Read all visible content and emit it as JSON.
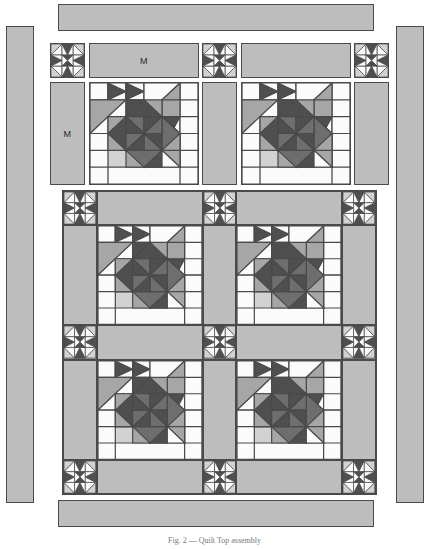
{
  "figure": {
    "caption": "Fig. 2 — Quilt Top assembly",
    "background_color": "#ffffff"
  },
  "palette": {
    "outline": "#4a4a4a",
    "sashing": "#bdbdbd",
    "border": "#bdbdbd",
    "background_light": "#f4f4f4",
    "white": "#fbfbfb",
    "light_gray": "#d2d2d2",
    "mid_gray": "#a6a6a6",
    "dark_gray": "#6e6e6e",
    "darkest_gray": "#4f4f4f"
  },
  "labels": {
    "sashing_mark": "M",
    "border_mark": "M"
  },
  "legend_marks": [
    {
      "name": "top-horizontal-sashing-mark",
      "text": "M"
    },
    {
      "name": "left-vertical-sashing-mark",
      "text": "M"
    }
  ],
  "components": {
    "outer_borders": [
      {
        "name": "outer-border-top",
        "label": "",
        "x": 58,
        "y": 4,
        "w": 316,
        "h": 27
      },
      {
        "name": "outer-border-left",
        "label": "",
        "x": 6,
        "y": 26,
        "w": 28,
        "h": 477
      },
      {
        "name": "outer-border-right",
        "label": "",
        "x": 396,
        "y": 26,
        "w": 28,
        "h": 477
      },
      {
        "name": "outer-border-bottom",
        "label": "",
        "x": 58,
        "y": 500,
        "w": 316,
        "h": 27
      }
    ],
    "top_row": [
      {
        "type": "pinwheel",
        "name": "pinwheel-top-left",
        "x": 50,
        "y": 43,
        "w": 35,
        "h": 35
      },
      {
        "type": "sashing",
        "name": "sashing-top-first",
        "label": "M",
        "x": 89,
        "y": 43,
        "w": 110,
        "h": 35
      },
      {
        "type": "pinwheel",
        "name": "pinwheel-top-center",
        "x": 202,
        "y": 43,
        "w": 35,
        "h": 35
      },
      {
        "type": "sashing",
        "name": "sashing-top-second",
        "label": "",
        "x": 241,
        "y": 43,
        "w": 110,
        "h": 35
      },
      {
        "type": "pinwheel",
        "name": "pinwheel-top-right",
        "x": 354,
        "y": 43,
        "w": 35,
        "h": 35
      }
    ],
    "second_row": [
      {
        "type": "sashing",
        "name": "sashing-left-vertical",
        "label": "M",
        "x": 50,
        "y": 82,
        "w": 35,
        "h": 103
      },
      {
        "type": "star",
        "name": "star-block-r1c1",
        "x": 89,
        "y": 82,
        "w": 110,
        "h": 103
      },
      {
        "type": "sashing",
        "name": "sashing-middle-vertical-top",
        "label": "",
        "x": 202,
        "y": 82,
        "w": 35,
        "h": 103
      },
      {
        "type": "star",
        "name": "star-block-r1c2",
        "x": 241,
        "y": 82,
        "w": 110,
        "h": 103
      },
      {
        "type": "sashing",
        "name": "sashing-right-vertical-top",
        "label": "",
        "x": 354,
        "y": 82,
        "w": 35,
        "h": 103
      }
    ],
    "lower_assembly": {
      "name": "quilt-center-assembled",
      "x": 62,
      "y": 190,
      "w": 315,
      "h": 305,
      "grid": {
        "cols": [
          35,
          110,
          35,
          110,
          35
        ],
        "rows": [
          35,
          103,
          35,
          103,
          35
        ]
      },
      "cells": [
        {
          "type": "pinwheel",
          "name": "pinwheel-c-r0c0",
          "r": 0,
          "c": 0
        },
        {
          "type": "sashing",
          "name": "sashing-c-r0c1",
          "r": 0,
          "c": 1
        },
        {
          "type": "pinwheel",
          "name": "pinwheel-c-r0c2",
          "r": 0,
          "c": 2
        },
        {
          "type": "sashing",
          "name": "sashing-c-r0c3",
          "r": 0,
          "c": 3
        },
        {
          "type": "pinwheel",
          "name": "pinwheel-c-r0c4",
          "r": 0,
          "c": 4
        },
        {
          "type": "sashing",
          "name": "sashing-c-r1c0",
          "r": 1,
          "c": 0
        },
        {
          "type": "star",
          "name": "star-c-r1c1",
          "r": 1,
          "c": 1
        },
        {
          "type": "sashing",
          "name": "sashing-c-r1c2",
          "r": 1,
          "c": 2
        },
        {
          "type": "star",
          "name": "star-c-r1c3",
          "r": 1,
          "c": 3
        },
        {
          "type": "sashing",
          "name": "sashing-c-r1c4",
          "r": 1,
          "c": 4
        },
        {
          "type": "pinwheel",
          "name": "pinwheel-c-r2c0",
          "r": 2,
          "c": 0
        },
        {
          "type": "sashing",
          "name": "sashing-c-r2c1",
          "r": 2,
          "c": 1
        },
        {
          "type": "pinwheel",
          "name": "pinwheel-c-r2c2",
          "r": 2,
          "c": 2
        },
        {
          "type": "sashing",
          "name": "sashing-c-r2c3",
          "r": 2,
          "c": 3
        },
        {
          "type": "pinwheel",
          "name": "pinwheel-c-r2c4",
          "r": 2,
          "c": 4
        },
        {
          "type": "sashing",
          "name": "sashing-c-r3c0",
          "r": 3,
          "c": 0
        },
        {
          "type": "star",
          "name": "star-c-r3c1",
          "r": 3,
          "c": 1
        },
        {
          "type": "sashing",
          "name": "sashing-c-r3c2",
          "r": 3,
          "c": 2
        },
        {
          "type": "star",
          "name": "star-c-r3c3",
          "r": 3,
          "c": 3
        },
        {
          "type": "sashing",
          "name": "sashing-c-r3c4",
          "r": 3,
          "c": 4
        },
        {
          "type": "pinwheel",
          "name": "pinwheel-c-r4c0",
          "r": 4,
          "c": 0
        },
        {
          "type": "sashing",
          "name": "sashing-c-r4c1",
          "r": 4,
          "c": 1
        },
        {
          "type": "pinwheel",
          "name": "pinwheel-c-r4c2",
          "r": 4,
          "c": 2
        },
        {
          "type": "sashing",
          "name": "sashing-c-r4c3",
          "r": 4,
          "c": 3
        },
        {
          "type": "pinwheel",
          "name": "pinwheel-c-r4c4",
          "r": 4,
          "c": 4
        }
      ]
    }
  },
  "block_designs": {
    "star": {
      "name": "feathered-star-block",
      "grid": 6,
      "description": "Six-by-six pieced star with central eight-point pinwheel star, flying-geese arms and half-square-triangle corners"
    },
    "pinwheel": {
      "name": "pinwheel-sashing-square",
      "grid": 3,
      "description": "Three-by-three pinwheel cornerstone with dark triangles"
    }
  }
}
